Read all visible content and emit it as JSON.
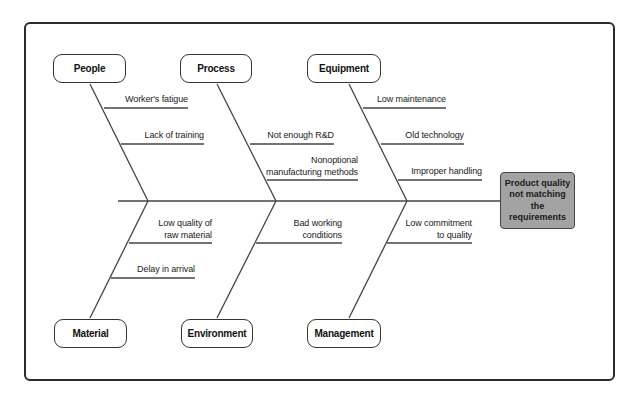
{
  "diagram": {
    "type": "fishbone",
    "effect": {
      "lines": [
        "Product quality",
        "not matching",
        "the requirements"
      ],
      "fill_color": "#a3a3a3"
    },
    "categories": [
      {
        "id": "people",
        "label": "People",
        "position": "top",
        "causes": [
          "Worker's fatigue",
          "Lack of training"
        ]
      },
      {
        "id": "process",
        "label": "Process",
        "position": "top",
        "causes": [
          "Not enough R&D",
          "Nonoptional manufacturing methods"
        ]
      },
      {
        "id": "equipment",
        "label": "Equipment",
        "position": "top",
        "causes": [
          "Low maintenance",
          "Old technology",
          "Improper handling"
        ]
      },
      {
        "id": "material",
        "label": "Material",
        "position": "bottom",
        "causes": [
          "Low quality of raw material",
          "Delay in arrival"
        ]
      },
      {
        "id": "environment",
        "label": "Environment",
        "position": "bottom",
        "causes": [
          "Bad working conditions"
        ]
      },
      {
        "id": "management",
        "label": "Management",
        "position": "bottom",
        "causes": [
          "Low commitment to quality"
        ]
      }
    ]
  },
  "labels": {
    "people": "People",
    "process": "Process",
    "equipment": "Equipment",
    "material": "Material",
    "environment": "Environment",
    "management": "Management",
    "effect_line1": "Product quality",
    "effect_line2": "not matching",
    "effect_line3": "the requirements",
    "c_workers_fatigue": "Worker's fatigue",
    "c_lack_training": "Lack of training",
    "c_not_enough_rd": "Not enough R&D",
    "c_nonoptional_1": "Nonoptional",
    "c_nonoptional_2": "manufacturing methods",
    "c_low_maintenance": "Low maintenance",
    "c_old_technology": "Old technology",
    "c_improper_handling": "Improper handling",
    "c_low_quality_1": "Low quality of",
    "c_low_quality_2": "raw material",
    "c_delay_arrival": "Delay in arrival",
    "c_bad_working_1": "Bad working",
    "c_bad_working_2": "conditions",
    "c_low_commit_1": "Low commitment",
    "c_low_commit_2": "to quality"
  }
}
